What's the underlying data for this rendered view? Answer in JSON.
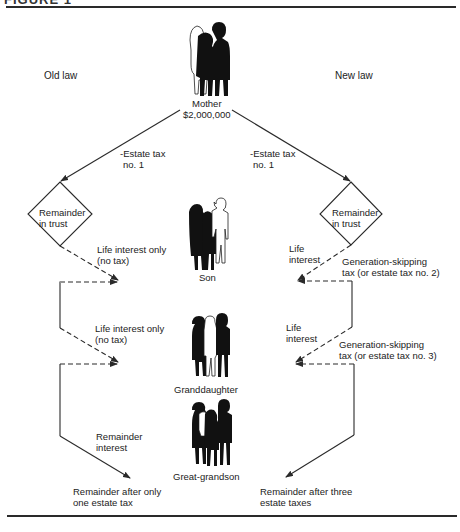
{
  "figure": {
    "heading_partial": "FIGURE 1"
  },
  "columns": {
    "left_title": "Old law",
    "right_title": "New law"
  },
  "people": {
    "mother": {
      "label": "Mother",
      "amount": "$2,000,000"
    },
    "son": {
      "label": "Son"
    },
    "granddaughter": {
      "label": "Granddaughter"
    },
    "great_grandson": {
      "label": "Great-grandson"
    }
  },
  "old_law": {
    "estate_tax": {
      "line1": "-Estate tax",
      "line2": "no. 1"
    },
    "trust": {
      "line1": "Remainder",
      "line2": "in trust"
    },
    "life_interest_1": {
      "line1": "Life interest only",
      "line2": "(no tax)"
    },
    "life_interest_2": {
      "line1": "Life interest only",
      "line2": "(no tax)"
    },
    "remainder_interest": {
      "line1": "Remainder",
      "line2": "interest"
    },
    "result": {
      "line1": "Remainder after only",
      "line2": "one estate tax"
    }
  },
  "new_law": {
    "estate_tax": {
      "line1": "-Estate tax",
      "line2": "no. 1"
    },
    "trust": {
      "line1": "Remainder",
      "line2": "in trust"
    },
    "life_interest_1": {
      "line1": "Life",
      "line2": "interest"
    },
    "gst_1": {
      "line1": "Generation-skipping",
      "line2": "tax (or estate tax no. 2)"
    },
    "life_interest_2": {
      "line1": "Life",
      "line2": "interest"
    },
    "gst_2": {
      "line1": "Generation-skipping",
      "line2": "tax (or estate tax no. 3)"
    },
    "result": {
      "line1": "Remainder after three",
      "line2": "estate taxes"
    }
  },
  "colors": {
    "line": "#2a2a2a",
    "silhouette": "#111111",
    "outline_figure": "#ffffff"
  }
}
